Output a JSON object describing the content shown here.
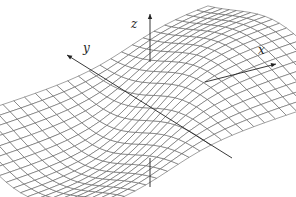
{
  "figure": {
    "type": "3d-wireframe-surface",
    "background": "#ffffff",
    "line_color": "#555555",
    "axis_color": "#222222",
    "axes": {
      "x": {
        "label": "x",
        "from": [
          25,
          146
        ],
        "to": [
          276,
          64
        ],
        "label_pos": [
          258,
          44
        ]
      },
      "y": {
        "label": "y",
        "from": [
          232,
          158
        ],
        "to": [
          67,
          55
        ],
        "label_pos": [
          83,
          42
        ]
      },
      "z": {
        "label": "z",
        "from": [
          150,
          187
        ],
        "to": [
          150,
          14
        ],
        "label_pos": [
          131,
          18
        ]
      }
    },
    "surface": {
      "grid_u": 24,
      "grid_v": 20,
      "description": "saddle-like wave surface with a ridge peak behind the z-axis and a trough in front"
    }
  }
}
